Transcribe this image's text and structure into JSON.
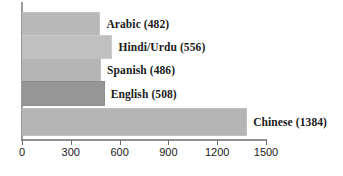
{
  "chart_data": {
    "type": "bar",
    "orientation": "horizontal",
    "title": "",
    "xlabel": "",
    "ylabel": "",
    "xlim": [
      0,
      1500
    ],
    "grid": false,
    "legend": "none",
    "xticks": [
      "0",
      "300",
      "600",
      "900",
      "1200",
      "1500"
    ],
    "xtick_values": [
      0,
      300,
      600,
      900,
      1200,
      1500
    ],
    "categories": [
      "Arabic",
      "Hindi/Urdu",
      "Spanish",
      "English",
      "Chinese"
    ],
    "values": [
      482,
      556,
      486,
      508,
      1384
    ],
    "bars": [
      {
        "label": "Arabic (482)",
        "category": "Arabic",
        "value": 482,
        "color": "#b8b8b8"
      },
      {
        "label": "Hindi/Urdu (556)",
        "category": "Hindi/Urdu",
        "value": 556,
        "color": "#c0c0c0"
      },
      {
        "label": "Spanish (486)",
        "category": "Spanish",
        "value": 486,
        "color": "#b5b5b5"
      },
      {
        "label": "English (508)",
        "category": "English",
        "value": 508,
        "color": "#969696"
      },
      {
        "label": "Chinese (1384)",
        "category": "Chinese",
        "value": 1384,
        "color": "#b4b4b4"
      }
    ]
  }
}
